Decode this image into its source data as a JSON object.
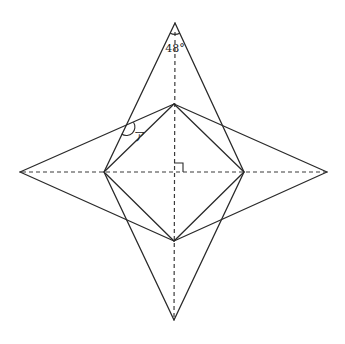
{
  "figure": {
    "title": "",
    "type": "geometry-star-net",
    "stroke_color": "#2a2a2a",
    "background": "#ffffff"
  },
  "points": {
    "top_tip": [
      175,
      23
    ],
    "right_tip": [
      327,
      172
    ],
    "bottom_tip": [
      174,
      320
    ],
    "left_tip": [
      20,
      172
    ],
    "inner_top": [
      174,
      104
    ],
    "inner_right": [
      244,
      172
    ],
    "inner_bottom": [
      174,
      241
    ],
    "inner_left": [
      104,
      172
    ],
    "center": [
      174,
      172
    ]
  },
  "labels": {
    "apex_angle": "48°",
    "angle_a": "ア"
  },
  "annotations": {
    "right_angle_at_center": true,
    "apex_angle_arc": true,
    "angle_a_arc": true
  }
}
